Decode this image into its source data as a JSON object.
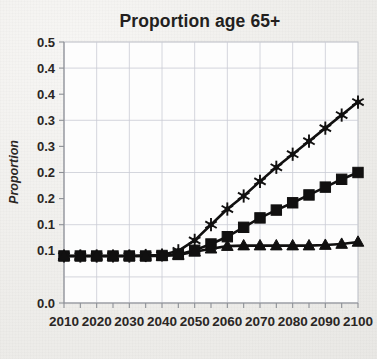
{
  "chart_data": {
    "type": "line",
    "title": "Proportion age 65+",
    "xlabel": "",
    "ylabel": "Proportion",
    "x": [
      2010,
      2015,
      2020,
      2025,
      2030,
      2035,
      2040,
      2045,
      2050,
      2055,
      2060,
      2065,
      2070,
      2075,
      2080,
      2085,
      2090,
      2095,
      2100
    ],
    "xtick_labels": [
      "2010",
      "2020",
      "2030",
      "2040",
      "2050",
      "2060",
      "2070",
      "2080",
      "2090",
      "2100"
    ],
    "xtick_values": [
      2010,
      2020,
      2030,
      2040,
      2050,
      2060,
      2070,
      2080,
      2090,
      2100
    ],
    "ytick_labels": [
      "0.5",
      "0.4",
      "0.4",
      "0.3",
      "0.3",
      "0.2",
      "0.2",
      "0.1",
      "0.1",
      "0.0"
    ],
    "ytick_values": [
      0.5,
      0.45,
      0.4,
      0.35,
      0.3,
      0.25,
      0.2,
      0.15,
      0.1,
      0.0
    ],
    "gridline_values": [
      0.45,
      0.35,
      0.25,
      0.15,
      0.05
    ],
    "xlim": [
      2010,
      2100
    ],
    "ylim": [
      0.0,
      0.5
    ],
    "grid": true,
    "legend": "none",
    "series": [
      {
        "name": "high-growth-scenario",
        "marker": "star",
        "values": [
          0.09,
          0.09,
          0.09,
          0.09,
          0.09,
          0.091,
          0.092,
          0.1,
          0.12,
          0.15,
          0.18,
          0.205,
          0.233,
          0.26,
          0.285,
          0.31,
          0.335,
          0.36,
          0.385
        ]
      },
      {
        "name": "medium-growth-scenario",
        "marker": "square",
        "values": [
          0.09,
          0.09,
          0.09,
          0.09,
          0.09,
          0.09,
          0.091,
          0.093,
          0.101,
          0.113,
          0.127,
          0.145,
          0.163,
          0.178,
          0.192,
          0.207,
          0.222,
          0.237,
          0.25
        ]
      },
      {
        "name": "low-growth-scenario",
        "marker": "triangle",
        "values": [
          0.09,
          0.09,
          0.09,
          0.09,
          0.09,
          0.09,
          0.09,
          0.092,
          0.098,
          0.104,
          0.109,
          0.11,
          0.11,
          0.11,
          0.11,
          0.11,
          0.111,
          0.113,
          0.117
        ]
      }
    ],
    "colors": {
      "series": "#111010",
      "grid": "#c9cbd4",
      "plot_background": "#fdfdfd",
      "page_background": "#f2f1ef",
      "text": "#2a2624"
    }
  }
}
